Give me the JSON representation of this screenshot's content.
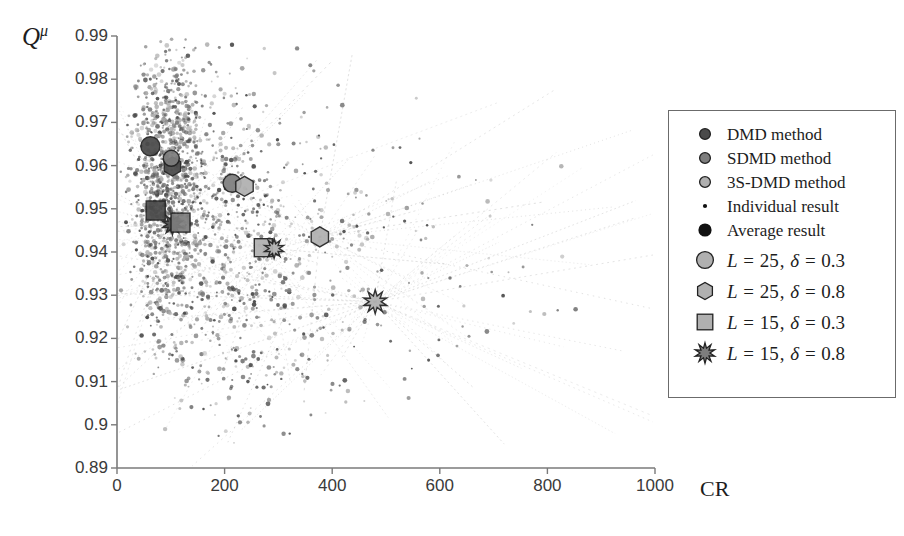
{
  "chart_data": {
    "type": "scatter",
    "title": "",
    "xlabel": "CR",
    "ylabel": "Q^μ",
    "ylabel_base": "Q",
    "ylabel_sup": "μ",
    "xlim": [
      0,
      1000
    ],
    "ylim": [
      0.89,
      0.99
    ],
    "xticks": [
      0,
      200,
      400,
      600,
      800,
      1000
    ],
    "yticks": [
      0.89,
      0.9,
      0.91,
      0.92,
      0.93,
      0.94,
      0.95,
      0.96,
      0.97,
      0.98,
      0.99
    ],
    "xtick_labels": [
      "0",
      "200",
      "400",
      "600",
      "800",
      "1000"
    ],
    "ytick_labels": [
      "0.89",
      "0.9",
      "0.91",
      "0.92",
      "0.93",
      "0.94",
      "0.95",
      "0.96",
      "0.97",
      "0.98",
      "0.99"
    ],
    "grid": false,
    "legend_position": "right",
    "colors": {
      "dmd": "#4a4a4a",
      "sdmd": "#7d7d7d",
      "s3dmd": "#b0b0b0",
      "outline": "#222222",
      "axis": "#7a7a7a",
      "text": "#1d1d1d",
      "connector": "#9a9a9a"
    },
    "average_results": [
      {
        "name": "dmd-L25-d03",
        "method": "DMD method",
        "shape": "circle",
        "L": 25,
        "delta": 0.3,
        "x": 62,
        "y": 0.9645,
        "size": 19
      },
      {
        "name": "dmd-L25-d08",
        "method": "DMD method",
        "shape": "hexagon",
        "L": 25,
        "delta": 0.8,
        "x": 103,
        "y": 0.9598,
        "size": 19
      },
      {
        "name": "sdmd-L25-d03",
        "method": "SDMD method",
        "shape": "circle",
        "L": 25,
        "delta": 0.3,
        "x": 101,
        "y": 0.9617,
        "size": 16
      },
      {
        "name": "dmd-L15-d03",
        "method": "DMD method",
        "shape": "square",
        "L": 15,
        "delta": 0.3,
        "x": 72,
        "y": 0.9496,
        "size": 19
      },
      {
        "name": "dmd-L15-d08",
        "method": "DMD method",
        "shape": "star",
        "L": 15,
        "delta": 0.8,
        "x": 103,
        "y": 0.9464,
        "size": 21
      },
      {
        "name": "sdmd-L15-d03",
        "method": "SDMD method",
        "shape": "square",
        "L": 15,
        "delta": 0.3,
        "x": 118,
        "y": 0.9468,
        "size": 19
      },
      {
        "name": "sdmd-L25-d03b",
        "method": "SDMD method",
        "shape": "circle",
        "L": 25,
        "delta": 0.3,
        "x": 214,
        "y": 0.9559,
        "size": 18
      },
      {
        "name": "s3dmd-L25-d08",
        "method": "3S-DMD method",
        "shape": "hexagon",
        "L": 25,
        "delta": 0.8,
        "x": 237,
        "y": 0.9552,
        "size": 20
      },
      {
        "name": "s3dmd-L15-d03",
        "method": "3S-DMD method",
        "shape": "square",
        "L": 15,
        "delta": 0.3,
        "x": 272,
        "y": 0.941,
        "size": 18
      },
      {
        "name": "s3dmd-L15-d08",
        "method": "3S-DMD method",
        "shape": "star",
        "L": 15,
        "delta": 0.8,
        "x": 292,
        "y": 0.9408,
        "size": 20
      },
      {
        "name": "s3dmd-L25-d08b",
        "method": "3S-DMD method",
        "shape": "hexagon",
        "L": 25,
        "delta": 0.8,
        "x": 377,
        "y": 0.9435,
        "size": 20
      },
      {
        "name": "s3dmd-L15-d08b",
        "method": "3S-DMD method",
        "shape": "star",
        "L": 15,
        "delta": 0.8,
        "x": 480,
        "y": 0.9285,
        "size": 24
      }
    ],
    "individual_clusters": [
      {
        "name": "cluster-dense-left",
        "cx": 90,
        "cy": 0.9555,
        "sx": 33,
        "sy": 0.0145,
        "n": 620,
        "seed": 11
      },
      {
        "name": "cluster-left-upper",
        "cx": 105,
        "cy": 0.969,
        "sx": 30,
        "sy": 0.009,
        "n": 240,
        "seed": 23
      },
      {
        "name": "cluster-left-lower",
        "cx": 96,
        "cy": 0.938,
        "sx": 30,
        "sy": 0.011,
        "n": 230,
        "seed": 37
      },
      {
        "name": "cluster-mid",
        "cx": 190,
        "cy": 0.952,
        "sx": 60,
        "sy": 0.016,
        "n": 300,
        "seed": 51
      },
      {
        "name": "cluster-mid-low",
        "cx": 235,
        "cy": 0.93,
        "sx": 75,
        "sy": 0.0125,
        "n": 190,
        "seed": 67
      },
      {
        "name": "cluster-right",
        "cx": 330,
        "cy": 0.947,
        "sx": 95,
        "sy": 0.0155,
        "n": 150,
        "seed": 83
      },
      {
        "name": "cluster-far-right",
        "cx": 470,
        "cy": 0.942,
        "sx": 130,
        "sy": 0.0145,
        "n": 70,
        "seed": 97
      },
      {
        "name": "cluster-tail",
        "cx": 640,
        "cy": 0.933,
        "sx": 150,
        "sy": 0.011,
        "n": 26,
        "seed": 109
      },
      {
        "name": "cluster-bottom",
        "cx": 260,
        "cy": 0.912,
        "sx": 110,
        "sy": 0.0075,
        "n": 90,
        "seed": 127
      }
    ],
    "connector_hubs": [
      {
        "name": "hub-main-star",
        "x": 480,
        "y": 0.9285,
        "rays": 46,
        "seed": 5
      },
      {
        "name": "hub-mid-hex",
        "x": 377,
        "y": 0.9435,
        "rays": 34,
        "seed": 17
      },
      {
        "name": "hub-left-star",
        "x": 103,
        "y": 0.9464,
        "rays": 30,
        "seed": 29
      },
      {
        "name": "hub-square-right",
        "x": 280,
        "y": 0.9409,
        "rays": 26,
        "seed": 41
      }
    ]
  },
  "legend": {
    "entries": [
      {
        "label": "DMD method",
        "marker": "circle-dark",
        "style": "plain",
        "name": "legend-dmd-method"
      },
      {
        "label": "SDMD method",
        "marker": "circle-mid",
        "style": "plain",
        "name": "legend-sdmd-method"
      },
      {
        "label": "3S-DMD method",
        "marker": "circle-light",
        "style": "plain",
        "name": "legend-3s-dmd-method"
      },
      {
        "label": "Individual result",
        "marker": "dot-small",
        "style": "plain",
        "name": "legend-individual-result"
      },
      {
        "label": "Average result",
        "marker": "dot-large",
        "style": "plain",
        "name": "legend-average-result"
      },
      {
        "label": "L = 25, δ = 0.3",
        "marker": "circle-shape",
        "style": "math",
        "L": "25",
        "delta": "0.3",
        "name": "legend-l25-d03"
      },
      {
        "label": "L = 25, δ = 0.8",
        "marker": "hexagon-shape",
        "style": "math",
        "L": "25",
        "delta": "0.8",
        "name": "legend-l25-d08"
      },
      {
        "label": "L = 15, δ = 0.3",
        "marker": "square-shape",
        "style": "math",
        "L": "15",
        "delta": "0.3",
        "name": "legend-l15-d03"
      },
      {
        "label": "L = 15, δ = 0.8",
        "marker": "star-shape",
        "style": "math",
        "L": "15",
        "delta": "0.8",
        "name": "legend-l15-d08"
      }
    ]
  }
}
